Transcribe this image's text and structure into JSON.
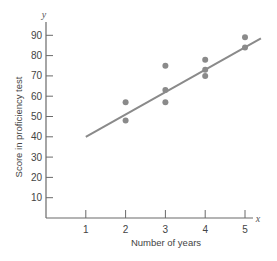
{
  "chart_data": {
    "type": "scatter",
    "title": "",
    "xlabel": "Number of years",
    "ylabel": "Score in proficiency test",
    "x_var": "x",
    "y_var": "y",
    "xlim": [
      0,
      5.5
    ],
    "ylim": [
      0,
      95
    ],
    "x_ticks": [
      1,
      2,
      3,
      4,
      5
    ],
    "y_ticks": [
      10,
      20,
      30,
      40,
      50,
      60,
      70,
      80,
      90
    ],
    "grid": false,
    "legend": null,
    "points": [
      {
        "x": 2,
        "y": 57
      },
      {
        "x": 2,
        "y": 48
      },
      {
        "x": 3,
        "y": 75
      },
      {
        "x": 3,
        "y": 63
      },
      {
        "x": 3,
        "y": 57
      },
      {
        "x": 4,
        "y": 78
      },
      {
        "x": 4,
        "y": 73
      },
      {
        "x": 4,
        "y": 70
      },
      {
        "x": 5,
        "y": 89
      },
      {
        "x": 5,
        "y": 84
      }
    ],
    "regression_line": {
      "x_start": 1,
      "y_start": 40,
      "x_end": 5.4,
      "y_end": 88.5
    },
    "colors": {
      "points": "#8a8a8a",
      "line": "#8a8a8a",
      "axes": "#6a6a6a",
      "text": "#444444"
    }
  }
}
